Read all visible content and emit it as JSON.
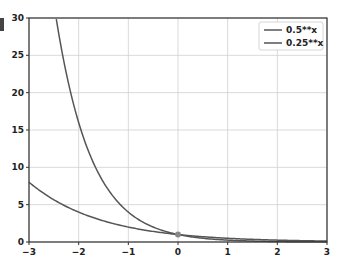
{
  "chart_data": {
    "type": "line",
    "title": "",
    "xlabel": "",
    "ylabel": "",
    "xlim": [
      -3,
      3
    ],
    "ylim": [
      0,
      30
    ],
    "grid": true,
    "legend_position": "upper right",
    "x_ticks": [
      "−3",
      "−2",
      "−1",
      "0",
      "1",
      "2",
      "3"
    ],
    "y_ticks": [
      "0",
      "5",
      "10",
      "15",
      "20",
      "25",
      "30"
    ],
    "series": [
      {
        "name": "0.5**x",
        "color": "#555555",
        "x": [
          -3,
          -2.5,
          -2,
          -1.5,
          -1,
          -0.5,
          0,
          0.5,
          1,
          1.5,
          2,
          2.5,
          3
        ],
        "y": [
          8,
          5.66,
          4,
          2.83,
          2,
          1.41,
          1,
          0.71,
          0.5,
          0.35,
          0.25,
          0.18,
          0.125
        ]
      },
      {
        "name": "0.25**x",
        "color": "#555555",
        "x": [
          -2.45,
          -2,
          -1.5,
          -1,
          -0.5,
          0,
          0.5,
          1,
          1.5,
          2,
          2.5,
          3
        ],
        "y": [
          30,
          16,
          8,
          4,
          2,
          1,
          0.5,
          0.25,
          0.125,
          0.0625,
          0.03,
          0.016
        ]
      }
    ],
    "annotations": [
      {
        "type": "marker",
        "x": 0,
        "y": 1
      }
    ]
  }
}
